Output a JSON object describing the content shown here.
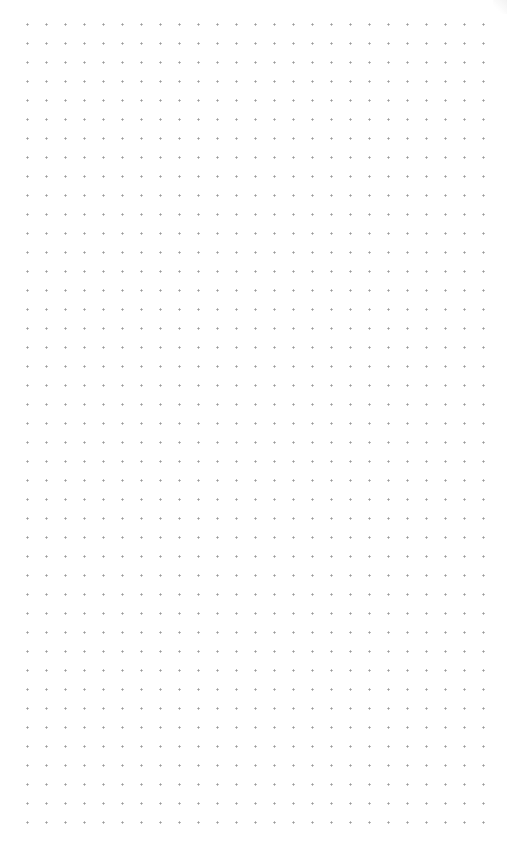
{
  "canvas": {
    "type": "dot-grid",
    "background_color": "#ffffff",
    "dot_color": "#9a9a9a",
    "dot_spacing_px": 19,
    "columns": 25,
    "rows": 43
  }
}
